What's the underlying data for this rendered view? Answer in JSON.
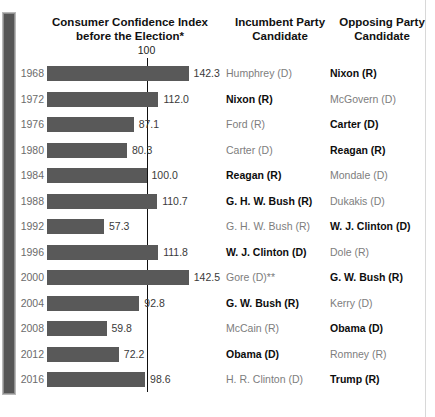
{
  "headers": {
    "chart_title_line1": "Consumer Confidence Index",
    "chart_title_line2": "before the Election*",
    "incumbent_line1": "Incumbent Party",
    "incumbent_line2": "Candidate",
    "opposing_line1": "Opposing Party",
    "opposing_line2": "Candidate"
  },
  "reference_line": {
    "label": "100",
    "value": 100
  },
  "colors": {
    "bar": "#595959",
    "reference_line": "#111111",
    "winner_text": "#0d0d0d",
    "loser_text": "#7d7d7d",
    "year_text": "#6b6b6b",
    "gutter": "#565656"
  },
  "rows": [
    {
      "year": "1968",
      "value": 142.3,
      "value_label": "142.3",
      "incumbent": "Humphrey (D)",
      "incumbent_winner": false,
      "opposing": "Nixon (R)",
      "opposing_winner": true
    },
    {
      "year": "1972",
      "value": 112.0,
      "value_label": "112.0",
      "incumbent": "Nixon (R)",
      "incumbent_winner": true,
      "opposing": "McGovern (D)",
      "opposing_winner": false
    },
    {
      "year": "1976",
      "value": 87.1,
      "value_label": "87.1",
      "incumbent": "Ford (R)",
      "incumbent_winner": false,
      "opposing": "Carter (D)",
      "opposing_winner": true
    },
    {
      "year": "1980",
      "value": 80.3,
      "value_label": "80.3",
      "incumbent": "Carter (D)",
      "incumbent_winner": false,
      "opposing": "Reagan (R)",
      "opposing_winner": true
    },
    {
      "year": "1984",
      "value": 100.0,
      "value_label": "100.0",
      "incumbent": "Reagan (R)",
      "incumbent_winner": true,
      "opposing": "Mondale (D)",
      "opposing_winner": false
    },
    {
      "year": "1988",
      "value": 110.7,
      "value_label": "110.7",
      "incumbent": "G. H. W. Bush (R)",
      "incumbent_winner": true,
      "opposing": "Dukakis (D)",
      "opposing_winner": false
    },
    {
      "year": "1992",
      "value": 57.3,
      "value_label": "57.3",
      "incumbent": "G. H. W. Bush (R)",
      "incumbent_winner": false,
      "opposing": "W. J. Clinton (D)",
      "opposing_winner": true
    },
    {
      "year": "1996",
      "value": 111.8,
      "value_label": "111.8",
      "incumbent": "W. J. Clinton (D)",
      "incumbent_winner": true,
      "opposing": "Dole (R)",
      "opposing_winner": false
    },
    {
      "year": "2000",
      "value": 142.5,
      "value_label": "142.5",
      "incumbent": "Gore (D)**",
      "incumbent_winner": false,
      "opposing": "G. W. Bush (R)",
      "opposing_winner": true
    },
    {
      "year": "2004",
      "value": 92.8,
      "value_label": "92.8",
      "incumbent": "G. W. Bush (R)",
      "incumbent_winner": true,
      "opposing": "Kerry (D)",
      "opposing_winner": false
    },
    {
      "year": "2008",
      "value": 59.8,
      "value_label": "59.8",
      "incumbent": "McCain (R)",
      "incumbent_winner": false,
      "opposing": "Obama (D)",
      "opposing_winner": true
    },
    {
      "year": "2012",
      "value": 72.2,
      "value_label": "72.2",
      "incumbent": "Obama (D)",
      "incumbent_winner": true,
      "opposing": "Romney (R)",
      "opposing_winner": false
    },
    {
      "year": "2016",
      "value": 98.6,
      "value_label": "98.6",
      "incumbent": "H. R. Clinton (D)",
      "incumbent_winner": false,
      "opposing": "Trump (R)",
      "opposing_winner": true
    }
  ],
  "chart_data": {
    "type": "bar",
    "title": "Consumer Confidence Index before the Election*",
    "orientation": "horizontal",
    "xlabel": "",
    "ylabel": "",
    "categories": [
      "1968",
      "1972",
      "1976",
      "1980",
      "1984",
      "1988",
      "1992",
      "1996",
      "2000",
      "2004",
      "2008",
      "2012",
      "2016"
    ],
    "values": [
      142.3,
      112.0,
      87.1,
      80.3,
      100.0,
      110.7,
      57.3,
      111.8,
      142.5,
      92.8,
      59.8,
      72.2,
      98.6
    ],
    "xlim": [
      0,
      150
    ],
    "grid": false,
    "legend": "none",
    "reference_lines": [
      {
        "value": 100,
        "label": "100",
        "orientation": "vertical"
      }
    ],
    "annotations": [
      "Bold candidate name in each row indicates the winner of that election",
      "* footnote marker on chart title",
      "** footnote marker on Gore (D) in 2000"
    ],
    "extra_columns": {
      "Incumbent Party Candidate": [
        "Humphrey (D)",
        "Nixon (R)",
        "Ford (R)",
        "Carter (D)",
        "Reagan (R)",
        "G. H. W. Bush (R)",
        "G. H. W. Bush (R)",
        "W. J. Clinton (D)",
        "Gore (D)**",
        "G. W. Bush (R)",
        "McCain (R)",
        "Obama (D)",
        "H. R. Clinton (D)"
      ],
      "Opposing Party Candidate": [
        "Nixon (R)",
        "McGovern (D)",
        "Carter (D)",
        "Reagan (R)",
        "Mondale (D)",
        "Dukakis (D)",
        "W. J. Clinton (D)",
        "Dole (R)",
        "G. W. Bush (R)",
        "Kerry (D)",
        "Obama (D)",
        "Romney (R)",
        "Trump (R)"
      ],
      "Election winner": [
        "Nixon (R)",
        "Nixon (R)",
        "Carter (D)",
        "Reagan (R)",
        "Reagan (R)",
        "G. H. W. Bush (R)",
        "W. J. Clinton (D)",
        "W. J. Clinton (D)",
        "G. W. Bush (R)",
        "G. W. Bush (R)",
        "Obama (D)",
        "Obama (D)",
        "Trump (R)"
      ]
    }
  }
}
